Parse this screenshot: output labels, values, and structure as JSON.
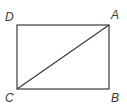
{
  "diagram": {
    "type": "rectangle-with-diagonal",
    "stroke_color": "#3a3a3a",
    "background": "#ffffff",
    "vertices": {
      "A": {
        "label": "A",
        "position": "top-right",
        "x": 109,
        "y": 25
      },
      "B": {
        "label": "B",
        "position": "bottom-right",
        "x": 109,
        "y": 89
      },
      "C": {
        "label": "C",
        "position": "bottom-left",
        "x": 17,
        "y": 89
      },
      "D": {
        "label": "D",
        "position": "top-left",
        "x": 17,
        "y": 25
      }
    },
    "segments": [
      {
        "from": "D",
        "to": "A"
      },
      {
        "from": "A",
        "to": "B"
      },
      {
        "from": "B",
        "to": "C"
      },
      {
        "from": "C",
        "to": "D"
      },
      {
        "from": "C",
        "to": "A",
        "role": "diagonal"
      }
    ]
  }
}
